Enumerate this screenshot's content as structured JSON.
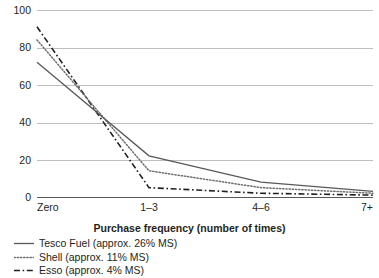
{
  "chart_data": {
    "type": "line",
    "title": "",
    "xlabel": "Purchase frequency (number of times)",
    "ylabel": "",
    "categories": [
      "Zero",
      "1–3",
      "4–6",
      "7+"
    ],
    "ylim": [
      0,
      100
    ],
    "yticks": [
      0,
      20,
      40,
      60,
      80,
      100
    ],
    "ytick_labels": [
      "0",
      "20",
      "40",
      "60",
      "80",
      "100"
    ],
    "grid": true,
    "legend_position": "bottom-left",
    "series": [
      {
        "name": "Tesco Fuel (approx. 26% MS)",
        "short_name": "Tesco Fuel",
        "market_share": "approx. 26% MS",
        "style": "solid",
        "color": "#58595b",
        "values": [
          72,
          22,
          8,
          3
        ]
      },
      {
        "name": "Shell (approx. 11% MS)",
        "short_name": "Shell",
        "market_share": "approx. 11% MS",
        "style": "dotted",
        "color": "#58595b",
        "values": [
          84,
          14,
          5,
          2
        ]
      },
      {
        "name": "Esso (approx. 4% MS)",
        "short_name": "Esso",
        "market_share": "approx. 4% MS",
        "style": "dashdot",
        "color": "#231f20",
        "values": [
          91,
          5,
          2,
          1
        ]
      }
    ]
  },
  "axis": {
    "x_title": "Purchase frequency (number of times)"
  }
}
